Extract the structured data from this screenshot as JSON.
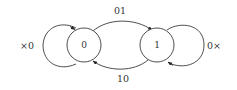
{
  "diagram": {
    "type": "state-machine",
    "nodes": [
      {
        "id": "s0",
        "label": "0"
      },
      {
        "id": "s1",
        "label": "1"
      }
    ],
    "edges": [
      {
        "from": "s0",
        "to": "s0",
        "label": "×0"
      },
      {
        "from": "s0",
        "to": "s1",
        "label": "01"
      },
      {
        "from": "s1",
        "to": "s0",
        "label": "10"
      },
      {
        "from": "s1",
        "to": "s1",
        "label": "0×"
      }
    ]
  }
}
